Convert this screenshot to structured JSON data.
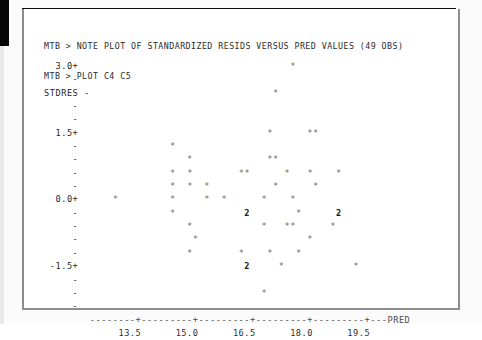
{
  "window": {
    "app": "Minitab",
    "prompt": "MTB >"
  },
  "session": {
    "lines": [
      "MTB > NOTE PLOT OF STANDARDIZED RESIDS VERSUS PRED VALUES (49 OBS)",
      "MTB > PLOT C4 C5"
    ],
    "command_1": "MTB > NOTE PLOT OF STANDARDIZED RESIDS VERSUS PRED VALUES (49 OBS)",
    "command_2": "MTB > PLOT C4 C5",
    "note_text": "NOTE PLOT OF STANDARDIZED RESIDS VERSUS PRED VALUES (49 OBS)",
    "plot_command": "PLOT C4 C5",
    "observations": "49 OBS",
    "y_column": "C4",
    "x_column": "C5"
  },
  "chart_data": {
    "type": "scatter",
    "title": "PLOT OF STANDARDIZED RESIDS VERSUS PRED VALUES (49 OBS)",
    "xlabel": "PRED",
    "ylabel": "STDRES",
    "grid": false,
    "legend": null,
    "xlim": [
      12.6,
      20.4
    ],
    "ylim": [
      -2.1,
      3.15
    ],
    "x_ticks": [
      "13.5",
      "15.0",
      "16.5",
      "18.0",
      "19.5"
    ],
    "x_tick_values": [
      13.5,
      15.0,
      16.5,
      18.0,
      19.5
    ],
    "y_ticks": [
      "3.0+",
      "1.5+",
      "0.0+",
      "-1.5+"
    ],
    "y_tick_values": [
      3.0,
      1.5,
      0.0,
      -1.5
    ],
    "point_marker": "*",
    "overlap_marker": "2",
    "overlap_note": "a '2' indicates two observations plotted at the same character cell",
    "n_observations": 49,
    "points": [
      {
        "x": 17.3,
        "y": 2.85,
        "marker": "*",
        "count": 1
      },
      {
        "x": 17.0,
        "y": 2.3,
        "marker": "*",
        "count": 1
      },
      {
        "x": 16.7,
        "y": 1.5,
        "marker": "*",
        "count": 1
      },
      {
        "x": 18.0,
        "y": 1.5,
        "marker": "*",
        "count": 1
      },
      {
        "x": 18.2,
        "y": 1.5,
        "marker": "*",
        "count": 1
      },
      {
        "x": 14.4,
        "y": 1.22,
        "marker": "*",
        "count": 1
      },
      {
        "x": 14.8,
        "y": 0.95,
        "marker": "*",
        "count": 1
      },
      {
        "x": 16.1,
        "y": 0.95,
        "marker": "*",
        "count": 1
      },
      {
        "x": 16.3,
        "y": 0.95,
        "marker": "*",
        "count": 1
      },
      {
        "x": 14.3,
        "y": 0.68,
        "marker": "*",
        "count": 1
      },
      {
        "x": 14.7,
        "y": 0.68,
        "marker": "*",
        "count": 1
      },
      {
        "x": 16.6,
        "y": 0.68,
        "marker": "*",
        "count": 1
      },
      {
        "x": 16.8,
        "y": 0.68,
        "marker": "*",
        "count": 1
      },
      {
        "x": 17.6,
        "y": 0.68,
        "marker": "*",
        "count": 1
      },
      {
        "x": 18.1,
        "y": 0.68,
        "marker": "*",
        "count": 1
      },
      {
        "x": 18.7,
        "y": 0.68,
        "marker": "*",
        "count": 1
      },
      {
        "x": 14.3,
        "y": 0.4,
        "marker": "*",
        "count": 1
      },
      {
        "x": 14.6,
        "y": 0.4,
        "marker": "*",
        "count": 1
      },
      {
        "x": 15.0,
        "y": 0.4,
        "marker": "*",
        "count": 1
      },
      {
        "x": 16.6,
        "y": 0.4,
        "marker": "*",
        "count": 1
      },
      {
        "x": 18.0,
        "y": 0.4,
        "marker": "*",
        "count": 1
      },
      {
        "x": 13.1,
        "y": 0.0,
        "marker": "*",
        "count": 1
      },
      {
        "x": 14.2,
        "y": 0.0,
        "marker": "*",
        "count": 1
      },
      {
        "x": 15.0,
        "y": 0.0,
        "marker": "*",
        "count": 1
      },
      {
        "x": 15.2,
        "y": 0.0,
        "marker": "*",
        "count": 1
      },
      {
        "x": 17.1,
        "y": 0.0,
        "marker": "*",
        "count": 1
      },
      {
        "x": 17.5,
        "y": 0.0,
        "marker": "*",
        "count": 1
      },
      {
        "x": 14.2,
        "y": -0.28,
        "marker": "*",
        "count": 1
      },
      {
        "x": 16.2,
        "y": -0.28,
        "marker": "2",
        "count": 2
      },
      {
        "x": 18.0,
        "y": -0.28,
        "marker": "*",
        "count": 1
      },
      {
        "x": 18.9,
        "y": -0.28,
        "marker": "2",
        "count": 2
      },
      {
        "x": 15.0,
        "y": -0.55,
        "marker": "*",
        "count": 1
      },
      {
        "x": 16.7,
        "y": -0.55,
        "marker": "*",
        "count": 1
      },
      {
        "x": 17.3,
        "y": -0.55,
        "marker": "*",
        "count": 1
      },
      {
        "x": 17.5,
        "y": -0.55,
        "marker": "*",
        "count": 1
      },
      {
        "x": 15.2,
        "y": -0.82,
        "marker": "*",
        "count": 1
      },
      {
        "x": 18.3,
        "y": -0.82,
        "marker": "*",
        "count": 1
      },
      {
        "x": 15.0,
        "y": -1.1,
        "marker": "*",
        "count": 1
      },
      {
        "x": 16.0,
        "y": -1.1,
        "marker": "*",
        "count": 1
      },
      {
        "x": 16.4,
        "y": -1.1,
        "marker": "*",
        "count": 1
      },
      {
        "x": 16.8,
        "y": -1.1,
        "marker": "*",
        "count": 1
      },
      {
        "x": 16.3,
        "y": -1.5,
        "marker": "2",
        "count": 2
      },
      {
        "x": 17.2,
        "y": -1.5,
        "marker": "*",
        "count": 1
      },
      {
        "x": 19.6,
        "y": -1.5,
        "marker": "*",
        "count": 1
      },
      {
        "x": 16.6,
        "y": -1.9,
        "marker": "*",
        "count": 1
      }
    ]
  },
  "plot_rows": [
    {
      "label": "  3.0+",
      "cells": "                                  *"
    },
    {
      "label": "     -",
      "cells": ""
    },
    {
      "label": "STDRES -",
      "cells": "                               *"
    },
    {
      "label": "     -",
      "cells": ""
    },
    {
      "label": "     -",
      "cells": ""
    },
    {
      "label": "  1.5+",
      "cells": "                              *      **"
    },
    {
      "label": "     -",
      "cells": "             *"
    },
    {
      "label": "     -",
      "cells": "                *             **"
    },
    {
      "label": "     -",
      "cells": "             *  *        **      *   *    *"
    },
    {
      "label": "     -",
      "cells": "             *  *  *           *      *"
    },
    {
      "label": "  0.0+",
      "cells": "   *         *     *  *      *    *"
    },
    {
      "label": "     -",
      "cells": "             *            2        *      2"
    },
    {
      "label": "     -",
      "cells": "                *            *   **      *"
    },
    {
      "label": "     -",
      "cells": "                 *                   *"
    },
    {
      "label": "     -",
      "cells": "                *        *    *    *"
    },
    {
      "label": " -1.5+",
      "cells": "                          2     *            *"
    },
    {
      "label": "     -",
      "cells": ""
    },
    {
      "label": "     -",
      "cells": "                             *"
    },
    {
      "label": "     -",
      "cells": ""
    }
  ],
  "axis": {
    "x_axis_line": "  --------+---------+---------+---------+---------+---PRED",
    "x_tick_label_line": "       13.5      15.0      16.5      18.0      19.5",
    "x_title": "PRED",
    "y_title": "STDRES"
  }
}
